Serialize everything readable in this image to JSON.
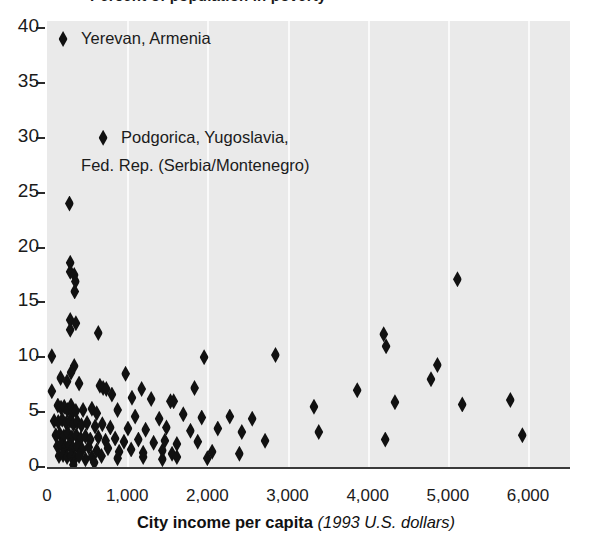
{
  "title_clipped": "Percent of population in poverty",
  "axes": {
    "x_title_bold": "City income per capita",
    "x_title_italic": "(1993 U.S. dollars)",
    "x_ticks": [
      "0",
      "1,000",
      "2,000",
      "3,000",
      "4,000",
      "5,000",
      "6,000"
    ],
    "y_ticks": [
      "0",
      "5",
      "10",
      "15",
      "20",
      "25",
      "30",
      "35",
      "40"
    ]
  },
  "annotations": [
    {
      "name": "yerevan",
      "text": "Yerevan, Armenia",
      "x": 200,
      "y": 39
    },
    {
      "name": "podgorica-line1",
      "text": "Podgorica, Yugoslavia,",
      "x": 700,
      "y": 30
    },
    {
      "name": "podgorica-line2",
      "text": "Fed. Rep. (Serbia/Montenegro)",
      "x": 700,
      "y": 27.4
    }
  ],
  "chart_data": {
    "type": "scatter",
    "title": "Percent of population in poverty",
    "xlabel": "City income per capita (1993 U.S. dollars)",
    "ylabel": "",
    "xlim": [
      0,
      6000
    ],
    "ylim": [
      0,
      40
    ],
    "grid": "vertical",
    "legend": "none",
    "marker": "diamond",
    "marker_color": "#111111",
    "plot_background": "#eaeaea",
    "series": [
      {
        "name": "Cities",
        "points": [
          [
            200,
            39.0
          ],
          [
            700,
            30.0
          ],
          [
            280,
            24.0
          ],
          [
            290,
            18.6
          ],
          [
            290,
            17.8
          ],
          [
            340,
            17.5
          ],
          [
            355,
            16.9
          ],
          [
            345,
            16.0
          ],
          [
            5120,
            17.1
          ],
          [
            290,
            13.4
          ],
          [
            290,
            12.5
          ],
          [
            360,
            13.1
          ],
          [
            640,
            12.2
          ],
          [
            4200,
            12.1
          ],
          [
            4230,
            11.0
          ],
          [
            60,
            10.1
          ],
          [
            2850,
            10.2
          ],
          [
            1960,
            10.0
          ],
          [
            4870,
            9.3
          ],
          [
            340,
            9.2
          ],
          [
            300,
            8.6
          ],
          [
            980,
            8.5
          ],
          [
            4790,
            8.0
          ],
          [
            170,
            8.1
          ],
          [
            250,
            7.8
          ],
          [
            400,
            7.6
          ],
          [
            60,
            6.9
          ],
          [
            3870,
            7.0
          ],
          [
            1840,
            7.2
          ],
          [
            1180,
            7.1
          ],
          [
            660,
            7.4
          ],
          [
            700,
            7.2
          ],
          [
            740,
            7.1
          ],
          [
            810,
            6.6
          ],
          [
            1060,
            6.3
          ],
          [
            1300,
            6.2
          ],
          [
            1540,
            6.0
          ],
          [
            1580,
            6.0
          ],
          [
            4340,
            5.9
          ],
          [
            5180,
            5.7
          ],
          [
            5780,
            6.1
          ],
          [
            3330,
            5.5
          ],
          [
            135,
            5.6
          ],
          [
            175,
            5.4
          ],
          [
            215,
            5.5
          ],
          [
            255,
            5.2
          ],
          [
            300,
            5.6
          ],
          [
            320,
            5.0
          ],
          [
            360,
            5.1
          ],
          [
            450,
            5.2
          ],
          [
            560,
            5.3
          ],
          [
            620,
            4.9
          ],
          [
            880,
            5.2
          ],
          [
            1100,
            4.6
          ],
          [
            1400,
            4.4
          ],
          [
            1700,
            4.8
          ],
          [
            1930,
            4.5
          ],
          [
            2280,
            4.6
          ],
          [
            2560,
            4.4
          ],
          [
            90,
            4.2
          ],
          [
            140,
            4.1
          ],
          [
            190,
            4.3
          ],
          [
            240,
            4.0
          ],
          [
            285,
            4.2
          ],
          [
            330,
            3.9
          ],
          [
            380,
            4.1
          ],
          [
            430,
            3.8
          ],
          [
            500,
            4.0
          ],
          [
            600,
            3.7
          ],
          [
            690,
            3.9
          ],
          [
            790,
            3.6
          ],
          [
            1010,
            3.5
          ],
          [
            1230,
            3.4
          ],
          [
            1490,
            3.6
          ],
          [
            1790,
            3.3
          ],
          [
            2130,
            3.5
          ],
          [
            2430,
            3.2
          ],
          [
            3390,
            3.2
          ],
          [
            4220,
            2.5
          ],
          [
            5930,
            2.9
          ],
          [
            110,
            2.9
          ],
          [
            160,
            3.0
          ],
          [
            210,
            2.8
          ],
          [
            260,
            3.1
          ],
          [
            310,
            2.7
          ],
          [
            365,
            2.9
          ],
          [
            420,
            2.6
          ],
          [
            480,
            2.8
          ],
          [
            540,
            2.5
          ],
          [
            640,
            2.7
          ],
          [
            730,
            2.4
          ],
          [
            850,
            2.6
          ],
          [
            960,
            2.3
          ],
          [
            1140,
            2.5
          ],
          [
            1330,
            2.2
          ],
          [
            1470,
            2.4
          ],
          [
            1620,
            2.1
          ],
          [
            1880,
            2.3
          ],
          [
            2720,
            2.4
          ],
          [
            130,
            1.9
          ],
          [
            180,
            2.0
          ],
          [
            230,
            1.8
          ],
          [
            275,
            2.0
          ],
          [
            325,
            1.7
          ],
          [
            375,
            1.9
          ],
          [
            440,
            1.6
          ],
          [
            520,
            1.8
          ],
          [
            620,
            1.5
          ],
          [
            760,
            1.7
          ],
          [
            900,
            1.4
          ],
          [
            1050,
            1.6
          ],
          [
            1200,
            1.3
          ],
          [
            1440,
            1.5
          ],
          [
            1560,
            1.2
          ],
          [
            2060,
            1.4
          ],
          [
            2400,
            1.2
          ],
          [
            150,
            1.0
          ],
          [
            200,
            1.1
          ],
          [
            250,
            0.9
          ],
          [
            300,
            1.0
          ],
          [
            350,
            0.8
          ],
          [
            400,
            1.0
          ],
          [
            480,
            0.7
          ],
          [
            560,
            0.9
          ],
          [
            680,
            1.0
          ],
          [
            880,
            0.8
          ],
          [
            1200,
            0.9
          ],
          [
            1440,
            0.7
          ],
          [
            1620,
            0.9
          ],
          [
            2000,
            0.8
          ],
          [
            330,
            0.2
          ],
          [
            590,
            0.4
          ]
        ]
      }
    ]
  }
}
